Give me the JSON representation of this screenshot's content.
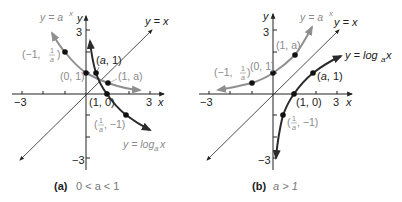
{
  "panels": [
    {
      "id": "a",
      "caption_tag": "(a)",
      "caption_condition": "0 < a < 1",
      "axis_x_label": "x",
      "axis_y_label": "y",
      "tick_labels": {
        "x_min": "−3",
        "x_max": "3",
        "y_max": "3",
        "y_min": "−3"
      },
      "curve_labels": {
        "exp": "y = a",
        "exp_sup": "x",
        "log": "y = log",
        "log_sub": "a",
        "log_var": " x",
        "identity": "y = x"
      },
      "points": [
        {
          "label": "(−1, 1/a)",
          "x": -1,
          "y": 2
        },
        {
          "label": "(0, 1)",
          "x": 0,
          "y": 1
        },
        {
          "label": "(a, 1)",
          "x": 0.5,
          "y": 1
        },
        {
          "label": "(1, a)",
          "x": 1,
          "y": 0.5
        },
        {
          "label": "(1, 0)",
          "x": 1,
          "y": 0
        },
        {
          "label": "(1/a, −1)",
          "x": 2,
          "y": -1
        }
      ]
    },
    {
      "id": "b",
      "caption_tag": "(b)",
      "caption_condition": "a > 1",
      "axis_x_label": "x",
      "axis_y_label": "y",
      "tick_labels": {
        "x_min": "−3",
        "x_max": "3",
        "y_max": "3",
        "y_min": "−3"
      },
      "curve_labels": {
        "exp": "y = a",
        "exp_sup": "x",
        "log": "y = log",
        "log_sub": "a",
        "log_var": " x",
        "identity": "y = x"
      },
      "points": [
        {
          "label": "(−1, 1/a)",
          "x": -1,
          "y": 0.55
        },
        {
          "label": "(0, 1)",
          "x": 0,
          "y": 1
        },
        {
          "label": "(1, a)",
          "x": 1,
          "y": 1.8
        },
        {
          "label": "(a, 1)",
          "x": 1.8,
          "y": 1
        },
        {
          "label": "(1, 0)",
          "x": 1,
          "y": 0
        },
        {
          "label": "(1/a, −1)",
          "x": 0.55,
          "y": -1
        }
      ]
    }
  ],
  "text": {
    "a_exp_label": "y = a",
    "x_sup": "x",
    "yx": "y = x",
    "log_label": "y = log",
    "log_sub": "a",
    "log_x": " x",
    "a_pt_m1": "(−1, ",
    "a_pt_m1_end": ")",
    "pt_01": "(0, 1)",
    "pt_a1": "(a, 1)",
    "pt_1a": "(1, a)",
    "pt_10": "(1, 0)",
    "pt_inv_start": "(",
    "pt_inv_end": ", −1)",
    "frac_num": "1",
    "frac_den": "a",
    "neg3": "−3",
    "pos3": "3",
    "x": "x",
    "y": "y",
    "cap_a_tag": "(a)",
    "cap_a_cond": "0 < a < 1",
    "cap_b_tag": "(b)",
    "cap_b_cond": "a > 1"
  }
}
